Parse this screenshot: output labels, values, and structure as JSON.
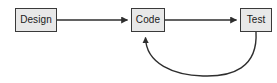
{
  "diagram": {
    "type": "flow-diagram",
    "canvas": {
      "width": 277,
      "height": 83,
      "background": "#ffffff"
    },
    "style": {
      "node_fill": "#e8e8e8",
      "node_border": "#3a3a3a",
      "text_color": "#1a1a1a",
      "connector_color": "#2e2e2e"
    },
    "nodes": [
      {
        "id": "design",
        "label": "Design",
        "x": 15,
        "y": 8,
        "width": 42,
        "height": 24
      },
      {
        "id": "code",
        "label": "Code",
        "x": 131,
        "y": 8,
        "width": 34,
        "height": 24
      },
      {
        "id": "test",
        "label": "Test",
        "x": 240,
        "y": 8,
        "width": 32,
        "height": 24
      }
    ],
    "connectors": [
      {
        "id": "design-to-code",
        "from": "design",
        "to": "code",
        "shape": "straight",
        "direction": "right",
        "arrowhead": "filled-triangle",
        "label": ""
      },
      {
        "id": "code-to-test",
        "from": "code",
        "to": "test",
        "shape": "straight",
        "direction": "right",
        "arrowhead": "filled-triangle",
        "label": ""
      },
      {
        "id": "test-to-code-feedback",
        "from": "test",
        "to": "code",
        "shape": "curved",
        "direction": "up",
        "arrowhead": "filled-triangle",
        "label": ""
      }
    ]
  }
}
